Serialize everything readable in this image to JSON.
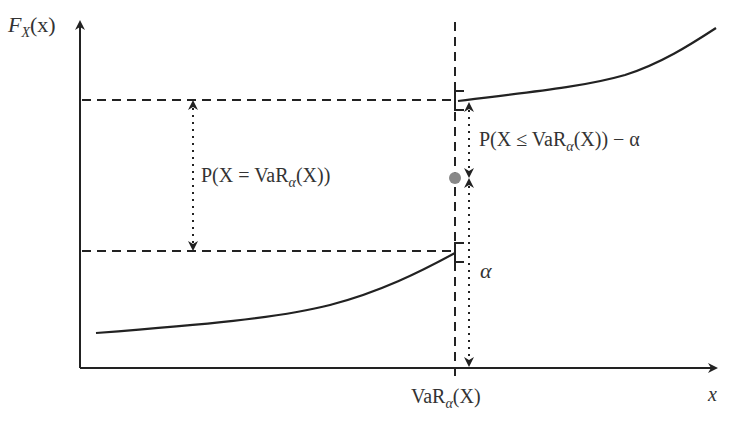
{
  "diagram": {
    "y_axis_label": {
      "main": "F",
      "sub": "X",
      "arg": "(x)"
    },
    "x_axis_label": "x",
    "var_tick_label": {
      "main": "VaR",
      "sub": "α",
      "arg": "(X)"
    },
    "jump_label": {
      "prefix": "P(X = VaR",
      "sub": "α",
      "suffix": "(X))"
    },
    "upper_gap_label": {
      "prefix": "P(X ≤ VaR",
      "sub": "α",
      "suffix": "(X)) − α"
    },
    "alpha_label": "α",
    "colors": {
      "line": "#222222",
      "dot": "#888888",
      "text": "#333333",
      "background": "#ffffff"
    }
  }
}
